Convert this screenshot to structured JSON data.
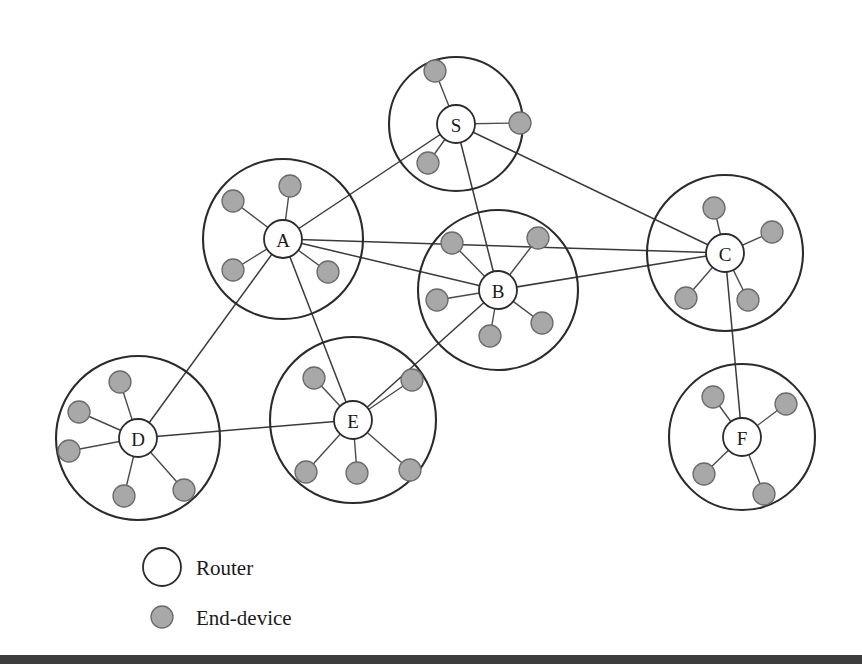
{
  "figure": {
    "width": 862,
    "height": 669,
    "background_color": "#ffffff"
  },
  "colors": {
    "router_fill": "#ffffff",
    "router_stroke": "#2b2b2b",
    "end_device_fill": "#a8a8a8",
    "end_device_stroke": "#6b6b6b",
    "cluster_stroke": "#2b2b2b",
    "link_stroke": "#3a3a3a",
    "spoke_stroke": "#4a4a4a",
    "text_color": "#1a1a1a",
    "bottom_rule": "#3d3d3d"
  },
  "clusters": [
    {
      "id": "S",
      "label": "S",
      "cx": 456,
      "cy": 124,
      "r": 67,
      "node_r": 19
    },
    {
      "id": "A",
      "label": "A",
      "cx": 283,
      "cy": 239,
      "r": 80,
      "node_r": 19
    },
    {
      "id": "B",
      "label": "B",
      "cx": 498,
      "cy": 290,
      "r": 80,
      "node_r": 19
    },
    {
      "id": "C",
      "label": "C",
      "cx": 725,
      "cy": 253,
      "r": 78,
      "node_r": 19
    },
    {
      "id": "D",
      "label": "D",
      "cx": 138,
      "cy": 438,
      "r": 82,
      "node_r": 19
    },
    {
      "id": "E",
      "label": "E",
      "cx": 353,
      "cy": 420,
      "r": 83,
      "node_r": 19
    },
    {
      "id": "F",
      "label": "F",
      "cx": 742,
      "cy": 437,
      "r": 73,
      "node_r": 19
    }
  ],
  "end_devices": [
    {
      "cluster": "S",
      "cx": 435,
      "cy": 71,
      "r": 11
    },
    {
      "cluster": "S",
      "cx": 520,
      "cy": 123,
      "r": 11
    },
    {
      "cluster": "S",
      "cx": 428,
      "cy": 163,
      "r": 11
    },
    {
      "cluster": "A",
      "cx": 290,
      "cy": 186,
      "r": 11
    },
    {
      "cluster": "A",
      "cx": 233,
      "cy": 201,
      "r": 11
    },
    {
      "cluster": "A",
      "cx": 233,
      "cy": 270,
      "r": 11
    },
    {
      "cluster": "A",
      "cx": 328,
      "cy": 272,
      "r": 11
    },
    {
      "cluster": "B",
      "cx": 452,
      "cy": 243,
      "r": 11
    },
    {
      "cluster": "B",
      "cx": 538,
      "cy": 238,
      "r": 11
    },
    {
      "cluster": "B",
      "cx": 437,
      "cy": 300,
      "r": 11
    },
    {
      "cluster": "B",
      "cx": 490,
      "cy": 336,
      "r": 11
    },
    {
      "cluster": "B",
      "cx": 542,
      "cy": 323,
      "r": 11
    },
    {
      "cluster": "C",
      "cx": 714,
      "cy": 208,
      "r": 11
    },
    {
      "cluster": "C",
      "cx": 772,
      "cy": 232,
      "r": 11
    },
    {
      "cluster": "C",
      "cx": 686,
      "cy": 298,
      "r": 11
    },
    {
      "cluster": "C",
      "cx": 748,
      "cy": 300,
      "r": 11
    },
    {
      "cluster": "D",
      "cx": 120,
      "cy": 382,
      "r": 11
    },
    {
      "cluster": "D",
      "cx": 79,
      "cy": 412,
      "r": 11
    },
    {
      "cluster": "D",
      "cx": 69,
      "cy": 451,
      "r": 11
    },
    {
      "cluster": "D",
      "cx": 124,
      "cy": 496,
      "r": 11
    },
    {
      "cluster": "D",
      "cx": 184,
      "cy": 490,
      "r": 11
    },
    {
      "cluster": "E",
      "cx": 314,
      "cy": 378,
      "r": 11
    },
    {
      "cluster": "E",
      "cx": 412,
      "cy": 380,
      "r": 11
    },
    {
      "cluster": "E",
      "cx": 306,
      "cy": 472,
      "r": 11
    },
    {
      "cluster": "E",
      "cx": 357,
      "cy": 473,
      "r": 11
    },
    {
      "cluster": "E",
      "cx": 410,
      "cy": 470,
      "r": 11
    },
    {
      "cluster": "F",
      "cx": 713,
      "cy": 397,
      "r": 11
    },
    {
      "cluster": "F",
      "cx": 786,
      "cy": 404,
      "r": 11
    },
    {
      "cluster": "F",
      "cx": 704,
      "cy": 474,
      "r": 11
    },
    {
      "cluster": "F",
      "cx": 764,
      "cy": 494,
      "r": 11
    }
  ],
  "links": [
    {
      "from": "S",
      "to": "A"
    },
    {
      "from": "S",
      "to": "B"
    },
    {
      "from": "S",
      "to": "C"
    },
    {
      "from": "A",
      "to": "B"
    },
    {
      "from": "A",
      "to": "C"
    },
    {
      "from": "A",
      "to": "D"
    },
    {
      "from": "A",
      "to": "E"
    },
    {
      "from": "B",
      "to": "C"
    },
    {
      "from": "B",
      "to": "E"
    },
    {
      "from": "C",
      "to": "F"
    },
    {
      "from": "D",
      "to": "E"
    }
  ],
  "legend": {
    "items": [
      {
        "key": "router",
        "label": "Router",
        "shape": "router-circle-icon",
        "swatch_cx": 162,
        "swatch_cy": 567,
        "swatch_r": 19
      },
      {
        "key": "end-device",
        "label": "End-device",
        "shape": "end-device-circle-icon",
        "swatch_cx": 162,
        "swatch_cy": 617,
        "swatch_r": 11
      }
    ],
    "label_x": 196
  },
  "bottom_rule": {
    "x": 0,
    "y": 655,
    "width": 862,
    "height": 9
  }
}
